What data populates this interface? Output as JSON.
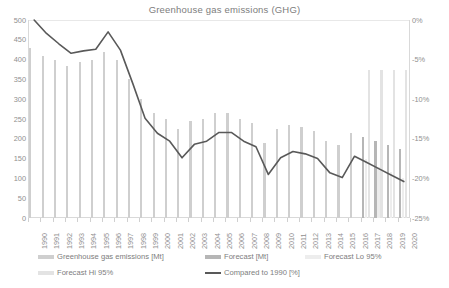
{
  "chart_data": {
    "type": "bar",
    "title": "Greenhouse gas emissions (GHG)",
    "xlabel": "",
    "ylabel": "",
    "y2label": "",
    "ylim": [
      0,
      500
    ],
    "y2lim": [
      -25,
      0
    ],
    "grid": false,
    "legend_position": "bottom",
    "categories": [
      "1990",
      "1991",
      "1992",
      "1993",
      "1994",
      "1995",
      "1996",
      "1997",
      "1998",
      "1999",
      "2000",
      "2001",
      "2002",
      "2003",
      "2004",
      "2005",
      "2006",
      "2007",
      "2008",
      "2009",
      "2010",
      "2011",
      "2012",
      "2013",
      "2014",
      "2015",
      "2016",
      "2017",
      "2018",
      "2019",
      "2020"
    ],
    "y_ticks": [
      0,
      50,
      100,
      150,
      200,
      250,
      300,
      350,
      400,
      450,
      500
    ],
    "y2_ticks": [
      "0%",
      "-5%",
      "-10%",
      "-15%",
      "-20%",
      "-25%"
    ],
    "series": [
      {
        "name": "Greenhouse gas emissions [Mt]",
        "type": "bar",
        "axis": "left",
        "color": "#cfcfcf",
        "values": [
          430,
          410,
          400,
          385,
          395,
          400,
          420,
          400,
          350,
          300,
          265,
          250,
          225,
          245,
          250,
          265,
          265,
          250,
          240,
          190,
          225,
          235,
          230,
          220,
          195,
          185,
          215,
          null,
          null,
          null,
          null
        ]
      },
      {
        "name": "Forecast [Mt]",
        "type": "bar",
        "axis": "left",
        "color": "#b6b6b6",
        "values": [
          null,
          null,
          null,
          null,
          null,
          null,
          null,
          null,
          null,
          null,
          null,
          null,
          null,
          null,
          null,
          null,
          null,
          null,
          null,
          null,
          null,
          null,
          null,
          null,
          null,
          null,
          null,
          205,
          195,
          185,
          175
        ]
      },
      {
        "name": "Forecast Lo 95%",
        "type": "bar",
        "axis": "left",
        "color": "#ededed",
        "values": [
          null,
          null,
          null,
          null,
          null,
          null,
          null,
          null,
          null,
          null,
          null,
          null,
          null,
          null,
          null,
          null,
          null,
          null,
          null,
          null,
          null,
          null,
          null,
          null,
          null,
          null,
          null,
          150,
          130,
          115,
          100
        ]
      },
      {
        "name": "Forecast Hi 95%",
        "type": "bar",
        "axis": "left",
        "color": "#e3e3e3",
        "values": [
          null,
          null,
          null,
          null,
          null,
          null,
          null,
          null,
          null,
          null,
          null,
          null,
          null,
          null,
          null,
          null,
          null,
          null,
          null,
          null,
          null,
          null,
          null,
          null,
          null,
          null,
          null,
          375,
          375,
          375,
          375
        ]
      },
      {
        "name": "Compared to 1990 [%]",
        "type": "line",
        "axis": "right",
        "color": "#595959",
        "values": [
          0.0,
          -1.7,
          -3.0,
          -4.2,
          -3.9,
          -3.7,
          -1.5,
          -3.8,
          -8.0,
          -12.4,
          -14.3,
          -15.3,
          -17.4,
          -15.7,
          -15.3,
          -14.2,
          -14.2,
          -15.3,
          -16.0,
          -19.5,
          -17.4,
          -16.6,
          -16.9,
          -17.5,
          -19.3,
          -19.9,
          -17.2,
          -18.0,
          -18.8,
          -19.6,
          -20.4
        ]
      }
    ],
    "legend": [
      {
        "label": "Greenhouse gas emissions [Mt]",
        "color": "#cfcfcf",
        "kind": "bar"
      },
      {
        "label": "Forecast [Mt]",
        "color": "#b6b6b6",
        "kind": "bar"
      },
      {
        "label": "Forecast Lo 95%",
        "color": "#ededed",
        "kind": "bar"
      },
      {
        "label": "Forecast Hi 95%",
        "color": "#e3e3e3",
        "kind": "bar"
      },
      {
        "label": "Compared to 1990 [%]",
        "color": "#595959",
        "kind": "line"
      }
    ]
  }
}
